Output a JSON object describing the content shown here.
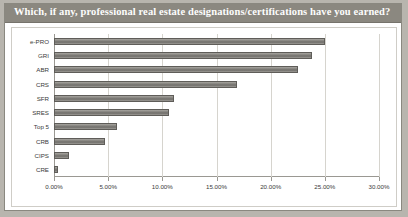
{
  "header": {
    "title": "Which, if any, professional real estate designations/certifications have you earned?"
  },
  "chart_data": {
    "type": "bar",
    "orientation": "horizontal",
    "title": "Which, if any, professional real estate designations/certifications have you earned?",
    "xlabel": "",
    "ylabel": "",
    "categories": [
      "e-PRO",
      "GRI",
      "ABR",
      "CRS",
      "SFR",
      "SRES",
      "Top 5",
      "CRB",
      "CIPS",
      "CRE"
    ],
    "values": [
      25.0,
      23.8,
      22.5,
      16.9,
      11.1,
      10.6,
      5.8,
      4.7,
      1.4,
      0.4
    ],
    "value_labels": [
      "25.00%",
      "23.80%",
      "22.50%",
      "16.90%",
      "11.10%",
      "10.60%",
      "5.80%",
      "4.70%",
      "1.40%",
      "0.40%"
    ],
    "xlim": [
      0,
      30
    ],
    "xticks": [
      0,
      5,
      10,
      15,
      20,
      25,
      30
    ],
    "xtick_labels": [
      "0.00%",
      "5.00%",
      "10.00%",
      "15.00%",
      "20.00%",
      "25.00%",
      "30.00%"
    ],
    "grid": true,
    "legend": false,
    "bar_color": "#8d8b86",
    "background": "#ffffff",
    "title_bar_color": "#8b8880"
  }
}
